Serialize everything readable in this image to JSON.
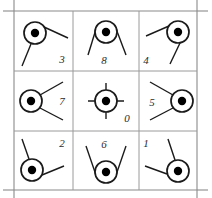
{
  "figure": {
    "type": "diagram",
    "grid": {
      "rows": 3,
      "cols": 3,
      "left": 14,
      "top": 11,
      "right": 197,
      "bottom": 190,
      "v_lines": [
        73,
        139
      ],
      "h_lines": [
        71,
        131
      ],
      "border_color": "#8a8a8a",
      "inner_line_color": "#9a9a9a",
      "tick_overhang": 11
    },
    "style": {
      "circle_radius": 11,
      "dot_radius": 4.2,
      "stroke_color": "#1a1a1a",
      "dot_color": "#000000",
      "circle_stroke_width": 1.7,
      "ray_stroke_width": 1.4,
      "background": "#ffffff"
    },
    "cells": [
      {
        "id": "cell-3",
        "label": "3",
        "row": 0,
        "col": 0,
        "label_x": 62,
        "label_y": 63,
        "circle_cx": 35,
        "circle_cy": 33,
        "crosshair": false,
        "rays": [
          {
            "x1": 44,
            "y1": 27,
            "x2": 68,
            "y2": 38
          },
          {
            "x1": 31,
            "y1": 44,
            "x2": 22,
            "y2": 66
          }
        ]
      },
      {
        "id": "cell-8",
        "label": "8",
        "row": 0,
        "col": 1,
        "label_x": 104,
        "label_y": 64,
        "circle_cx": 106,
        "circle_cy": 32,
        "crosshair": false,
        "rays": [
          {
            "x1": 97,
            "y1": 26,
            "x2": 88,
            "y2": 55
          },
          {
            "x1": 115,
            "y1": 26,
            "x2": 126,
            "y2": 55
          }
        ]
      },
      {
        "id": "cell-4",
        "label": "4",
        "row": 0,
        "col": 2,
        "label_x": 146,
        "label_y": 64,
        "circle_cx": 178,
        "circle_cy": 32,
        "crosshair": false,
        "rays": [
          {
            "x1": 169,
            "y1": 26,
            "x2": 146,
            "y2": 36
          },
          {
            "x1": 180,
            "y1": 43,
            "x2": 170,
            "y2": 64
          }
        ]
      },
      {
        "id": "cell-7",
        "label": "7",
        "row": 1,
        "col": 0,
        "label_x": 62,
        "label_y": 105,
        "circle_cx": 31,
        "circle_cy": 101,
        "crosshair": false,
        "rays": [
          {
            "x1": 40,
            "y1": 95,
            "x2": 63,
            "y2": 82
          },
          {
            "x1": 40,
            "y1": 108,
            "x2": 63,
            "y2": 120
          }
        ]
      },
      {
        "id": "cell-0",
        "label": "0",
        "row": 1,
        "col": 1,
        "label_x": 127,
        "label_y": 122,
        "circle_cx": 106,
        "circle_cy": 101,
        "crosshair": true,
        "rays": []
      },
      {
        "id": "cell-5",
        "label": "5",
        "row": 1,
        "col": 2,
        "label_x": 152,
        "label_y": 106,
        "circle_cx": 182,
        "circle_cy": 101,
        "crosshair": false,
        "rays": [
          {
            "x1": 173,
            "y1": 95,
            "x2": 150,
            "y2": 82
          },
          {
            "x1": 173,
            "y1": 108,
            "x2": 150,
            "y2": 120
          }
        ]
      },
      {
        "id": "cell-2",
        "label": "2",
        "row": 2,
        "col": 0,
        "label_x": 62,
        "label_y": 147,
        "circle_cx": 32,
        "circle_cy": 170,
        "crosshair": false,
        "rays": [
          {
            "x1": 29,
            "y1": 159,
            "x2": 22,
            "y2": 139
          },
          {
            "x1": 42,
            "y1": 175,
            "x2": 64,
            "y2": 166
          }
        ]
      },
      {
        "id": "cell-6",
        "label": "6",
        "row": 2,
        "col": 1,
        "label_x": 104,
        "label_y": 148,
        "circle_cx": 106,
        "circle_cy": 172,
        "crosshair": false,
        "rays": [
          {
            "x1": 97,
            "y1": 178,
            "x2": 86,
            "y2": 146
          },
          {
            "x1": 115,
            "y1": 178,
            "x2": 126,
            "y2": 146
          }
        ]
      },
      {
        "id": "cell-1",
        "label": "1",
        "row": 2,
        "col": 2,
        "label_x": 146,
        "label_y": 147,
        "circle_cx": 178,
        "circle_cy": 171,
        "crosshair": false,
        "rays": [
          {
            "x1": 175,
            "y1": 160,
            "x2": 168,
            "y2": 139
          },
          {
            "x1": 167,
            "y1": 174,
            "x2": 145,
            "y2": 166
          }
        ]
      }
    ]
  }
}
